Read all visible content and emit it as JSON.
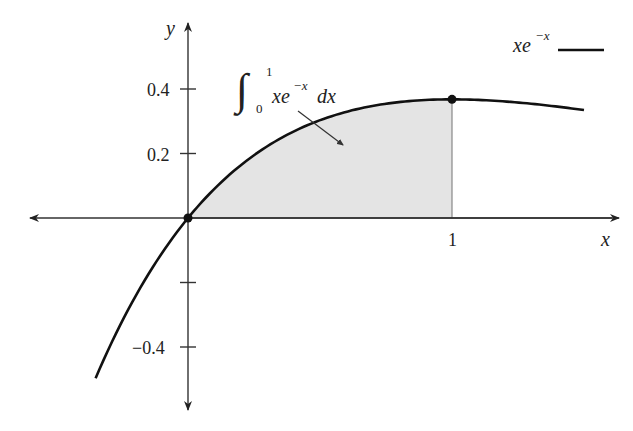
{
  "chart_data": {
    "type": "area",
    "title": "",
    "function": "x*e^(-x)",
    "xlabel": "x",
    "ylabel": "y",
    "xlim": [
      -0.61,
      1.62
    ],
    "ylim": [
      -0.6,
      0.6
    ],
    "grid": false,
    "x_ticks": [
      {
        "value": 1,
        "label": "1"
      }
    ],
    "y_ticks": [
      {
        "value": 0.4,
        "label": "0.4"
      },
      {
        "value": 0.2,
        "label": "0.2"
      },
      {
        "value": -0.2,
        "label": ""
      },
      {
        "value": -0.4,
        "label": "−0.4"
      }
    ],
    "curve_domain": [
      -0.35,
      1.5
    ],
    "series": [
      {
        "name": "xe^{-x}",
        "x": [
          -0.35,
          -0.25,
          -0.1,
          0,
          0.1,
          0.25,
          0.5,
          0.75,
          1.0,
          1.25,
          1.5
        ],
        "values": [
          -0.497,
          -0.321,
          -0.111,
          0,
          0.09,
          0.195,
          0.303,
          0.354,
          0.368,
          0.358,
          0.335
        ]
      }
    ],
    "shaded_region": {
      "from": 0,
      "to": 1,
      "label": "∫₀¹ xe^{-x} dx",
      "value": 0.2642
    },
    "marked_points": [
      {
        "x": 0,
        "y": 0
      },
      {
        "x": 1,
        "y": 0.368
      }
    ],
    "legend": {
      "position": "top-right",
      "entries": [
        {
          "label": "xe^{-x}",
          "style": "solid-black"
        }
      ]
    },
    "annotations": [
      {
        "text": "∫_0^1 xe^{-x} dx",
        "arrow_to": "shaded-region"
      }
    ]
  },
  "labels": {
    "y_axis": "y",
    "x_axis": "x",
    "tick_x_1": "1",
    "tick_y_04": "0.4",
    "tick_y_02": "0.2",
    "tick_y_m04": "−0.4",
    "integral_sign": "∫",
    "integral_upper": "1",
    "integral_lower": "0",
    "integrand_base": "xe",
    "integrand_exp": "−x",
    "integrand_dx": "dx",
    "legend_base": "xe",
    "legend_exp": "−x"
  },
  "colors": {
    "axis": "#333333",
    "curve": "#111111",
    "fill": "#e4e4e4",
    "text": "#222222"
  }
}
